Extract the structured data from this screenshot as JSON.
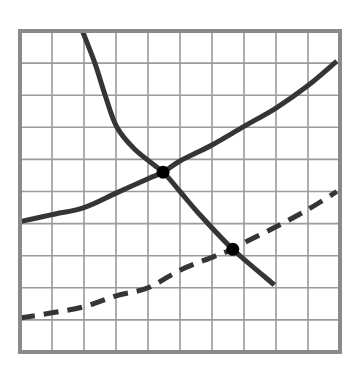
{
  "chart_data": {
    "type": "line",
    "title": "",
    "xlabel": "",
    "ylabel": "",
    "xlim": [
      0,
      10
    ],
    "ylim": [
      0,
      10
    ],
    "grid": true,
    "grid_step": 1,
    "legend": null,
    "tick_labels": {
      "x": [],
      "y": []
    },
    "series": [
      {
        "name": "downward-sloping curve",
        "style": "solid",
        "color": "#353535",
        "points": [
          [
            1.95,
            10.0
          ],
          [
            2.34,
            9.0
          ],
          [
            2.66,
            8.0
          ],
          [
            3.03,
            7.0
          ],
          [
            3.6,
            6.3
          ],
          [
            4.47,
            5.6
          ],
          [
            5.0,
            5.0
          ],
          [
            5.6,
            4.3
          ],
          [
            6.65,
            3.2
          ],
          [
            7.95,
            2.09
          ]
        ]
      },
      {
        "name": "upward-sloping curve (upper)",
        "style": "solid",
        "color": "#353535",
        "points": [
          [
            0,
            4.06
          ],
          [
            1,
            4.28
          ],
          [
            2,
            4.5
          ],
          [
            3,
            4.95
          ],
          [
            4,
            5.4
          ],
          [
            4.47,
            5.6
          ],
          [
            5,
            5.95
          ],
          [
            6,
            6.45
          ],
          [
            7,
            7.03
          ],
          [
            8,
            7.6
          ],
          [
            9,
            8.3
          ],
          [
            9.9,
            9.06
          ]
        ]
      },
      {
        "name": "upward-sloping curve (lower, dashed)",
        "style": "dashed",
        "color": "#353535",
        "points": [
          [
            0,
            1.06
          ],
          [
            1,
            1.22
          ],
          [
            2,
            1.41
          ],
          [
            3,
            1.75
          ],
          [
            4,
            2.0
          ],
          [
            5,
            2.55
          ],
          [
            6,
            2.95
          ],
          [
            6.65,
            3.2
          ],
          [
            7,
            3.4
          ],
          [
            8,
            3.9
          ],
          [
            9,
            4.44
          ],
          [
            9.9,
            5.0
          ]
        ]
      }
    ],
    "annotations": [
      {
        "type": "point",
        "label": "intersection-1",
        "x": 4.47,
        "y": 5.6
      },
      {
        "type": "point",
        "label": "intersection-2",
        "x": 6.65,
        "y": 3.2
      }
    ]
  },
  "layout": {
    "plot_left": 20,
    "plot_top": 31,
    "plot_right": 340,
    "plot_bottom": 352
  }
}
